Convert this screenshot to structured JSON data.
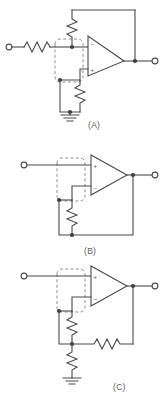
{
  "figure": {
    "background_color": "#ffffff",
    "line_color": "#4a4a4a",
    "dash_color": "#8e8e8e",
    "node_color": "#3c3c3c",
    "width": 164,
    "height": 400
  },
  "circuits": [
    {
      "id": "A",
      "caption": "(A)",
      "opamp": {
        "inverting_label": "−",
        "inverting_position": "top",
        "noninverting_label": "+",
        "noninverting_position": "bottom"
      },
      "components": [
        {
          "name": "input-series-resistor",
          "type": "resistor",
          "orientation": "horizontal"
        },
        {
          "name": "feedback-resistor",
          "type": "resistor",
          "orientation": "vertical"
        },
        {
          "name": "gain-resistor-to-ground",
          "type": "resistor",
          "orientation": "vertical"
        },
        {
          "name": "ground-symbol",
          "type": "ground"
        },
        {
          "name": "dashed-region",
          "type": "dashed-box"
        }
      ],
      "terminals": [
        {
          "name": "input-terminal",
          "side": "left"
        },
        {
          "name": "output-terminal",
          "side": "right"
        }
      ]
    },
    {
      "id": "B",
      "caption": "(B)",
      "opamp": {
        "inverting_label": "−",
        "inverting_position": "bottom",
        "noninverting_label": "+",
        "noninverting_position": "top"
      },
      "components": [
        {
          "name": "feedback-resistor",
          "type": "resistor",
          "orientation": "vertical"
        },
        {
          "name": "dashed-region",
          "type": "dashed-box"
        }
      ],
      "terminals": [
        {
          "name": "input-terminal",
          "side": "left"
        },
        {
          "name": "output-terminal",
          "side": "right"
        }
      ]
    },
    {
      "id": "C",
      "caption": "(C)",
      "opamp": {
        "inverting_label": "−",
        "inverting_position": "bottom",
        "noninverting_label": "+",
        "noninverting_position": "top"
      },
      "components": [
        {
          "name": "upper-divider-resistor",
          "type": "resistor",
          "orientation": "vertical"
        },
        {
          "name": "feedback-resistor",
          "type": "resistor",
          "orientation": "horizontal"
        },
        {
          "name": "lower-divider-resistor",
          "type": "resistor",
          "orientation": "vertical"
        },
        {
          "name": "ground-symbol",
          "type": "ground"
        },
        {
          "name": "dashed-region",
          "type": "dashed-box"
        }
      ],
      "terminals": [
        {
          "name": "input-terminal",
          "side": "left"
        },
        {
          "name": "output-terminal",
          "side": "right"
        }
      ]
    }
  ]
}
